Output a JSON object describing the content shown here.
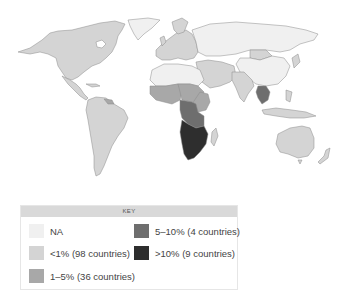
{
  "map": {
    "title": "",
    "projection": "world",
    "colors": {
      "na": "#f0f0f0",
      "lt1": "#d4d4d4",
      "1to5": "#a8a8a8",
      "5to10": "#6e6e6e",
      "gt10": "#2e2e2e",
      "border": "#8a8a8a",
      "ocean": "#ffffff"
    },
    "regions": [
      {
        "name": "North America",
        "category": "lt1"
      },
      {
        "name": "Greenland",
        "category": "na"
      },
      {
        "name": "Central America & Caribbean",
        "category": "lt1"
      },
      {
        "name": "South America",
        "category": "lt1"
      },
      {
        "name": "Europe",
        "category": "lt1"
      },
      {
        "name": "Russia & Central Asia",
        "category": "na"
      },
      {
        "name": "China",
        "category": "na"
      },
      {
        "name": "Middle East",
        "category": "lt1"
      },
      {
        "name": "North Africa",
        "category": "na"
      },
      {
        "name": "West Africa",
        "category": "1to5"
      },
      {
        "name": "Central/East Africa",
        "category": "5to10"
      },
      {
        "name": "Southern Africa",
        "category": "gt10"
      },
      {
        "name": "South Asia",
        "category": "lt1"
      },
      {
        "name": "Southeast Asia (Thailand/Myanmar)",
        "category": "5to10"
      },
      {
        "name": "Maritime SE Asia",
        "category": "lt1"
      },
      {
        "name": "Australia",
        "category": "lt1"
      },
      {
        "name": "New Zealand",
        "category": "lt1"
      },
      {
        "name": "Madagascar",
        "category": "lt1"
      }
    ]
  },
  "key": {
    "title": "KEY",
    "items": [
      {
        "label": "NA",
        "color": "#f0f0f0"
      },
      {
        "label": "<1% (98 countries)",
        "color": "#d4d4d4"
      },
      {
        "label": "1–5% (36 countries)",
        "color": "#a8a8a8"
      },
      {
        "label": "5–10% (4 countries)",
        "color": "#6e6e6e"
      },
      {
        "label": ">10% (9 countries)",
        "color": "#2e2e2e"
      }
    ]
  }
}
